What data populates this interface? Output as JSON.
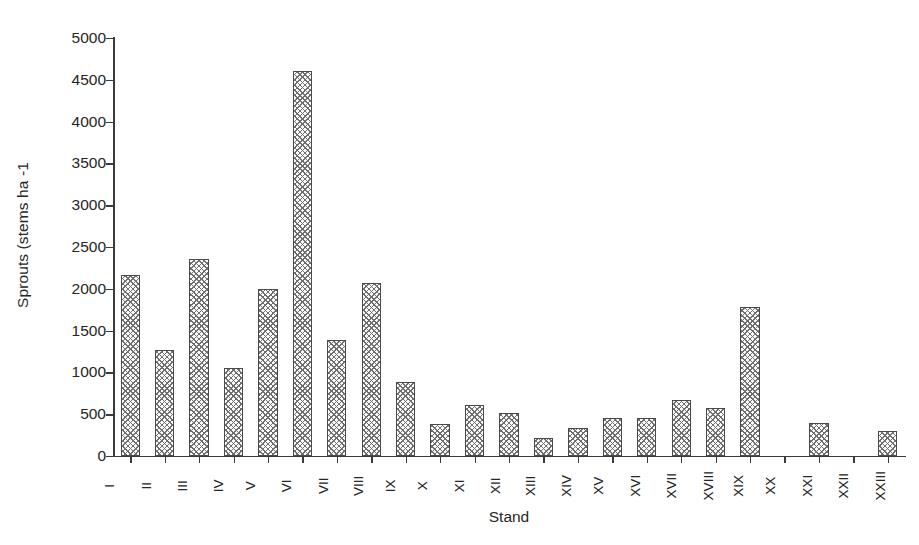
{
  "chart_data": {
    "type": "bar",
    "title": "",
    "xlabel": "Stand",
    "ylabel": "Sprouts (stems ha -1",
    "categories": [
      "I",
      "II",
      "III",
      "IV",
      "V",
      "VI",
      "VII",
      "VIII",
      "IX",
      "X",
      "XI",
      "XII",
      "XIII",
      "XIV",
      "XV",
      "XVI",
      "XVII",
      "XVIII",
      "XIX",
      "XX",
      "XXI",
      "XXII",
      "XXIII"
    ],
    "values": [
      2170,
      1270,
      2360,
      1055,
      2000,
      4610,
      1390,
      2065,
      885,
      385,
      610,
      510,
      215,
      335,
      455,
      455,
      665,
      575,
      1780,
      0,
      400,
      0,
      300
    ],
    "ylim": [
      0,
      5000
    ],
    "ytick_labels": [
      "0",
      "500",
      "1000",
      "1500",
      "2000",
      "2500",
      "3000",
      "3500",
      "4000",
      "4500",
      "5000"
    ],
    "ytick_values": [
      0,
      500,
      1000,
      1500,
      2000,
      2500,
      3000,
      3500,
      4000,
      4500,
      5000
    ],
    "grid": false,
    "legend": null,
    "bar_fill": "crosshatch",
    "bar_edge_color": "#4a4a4a",
    "bar_hatch_color": "#6e6e6e",
    "axis_color": "#3a3a3a",
    "background_color": "#ffffff",
    "text_color": "#262626"
  }
}
